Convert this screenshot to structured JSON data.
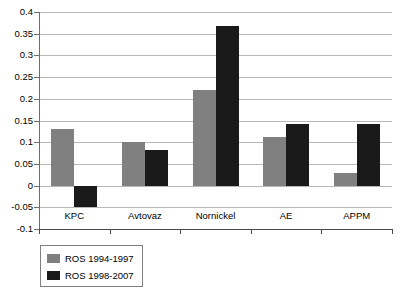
{
  "chart_data": {
    "type": "bar",
    "title": "",
    "subtitle": "",
    "xlabel": "",
    "ylabel": "",
    "categories": [
      "KPC",
      "Avtovaz",
      "Nornickel",
      "AE",
      "APPM"
    ],
    "series": [
      {
        "name": "ROS 1994-1997",
        "color": "#808080",
        "values": [
          0.13,
          0.1,
          0.22,
          0.111,
          0.03
        ]
      },
      {
        "name": "ROS 1998-2007",
        "color": "#1a1a1a",
        "values": [
          -0.05,
          0.082,
          0.368,
          0.143,
          0.143
        ]
      }
    ],
    "ylim": [
      -0.1,
      0.4
    ],
    "ytick_step": 0.05,
    "ytick_labels": [
      "0.4",
      "0.35",
      "0.3",
      "0.25",
      "0.2",
      "0.15",
      "0.1",
      "0.05",
      "0",
      "-0.05",
      "-0.1"
    ],
    "ytick_values": [
      0.4,
      0.35,
      0.3,
      0.25,
      0.2,
      0.15,
      0.1,
      0.05,
      0,
      -0.05,
      -0.1
    ],
    "grid": true,
    "grid_axis": "y",
    "legend_position": "bottom-left",
    "legend_entries": [
      "ROS 1994-1997",
      "ROS 1998-2007"
    ],
    "gridline_color": "#b8b8b8",
    "axis_color": "#4a4a4a",
    "background_color": "#ffffff"
  }
}
